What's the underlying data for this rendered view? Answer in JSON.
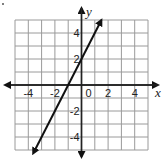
{
  "chart_data": {
    "type": "line",
    "title": "",
    "xlabel": "x",
    "ylabel": "y",
    "xlim": [
      -5,
      5
    ],
    "ylim": [
      -5,
      5
    ],
    "grid": true,
    "grid_step": 1,
    "x_tick_labels": [
      "-4",
      "-2",
      "0",
      "2",
      "4"
    ],
    "x_ticks": [
      -4,
      -2,
      0,
      2,
      4
    ],
    "y_tick_labels": [
      "4",
      "2",
      "-2",
      "-4"
    ],
    "y_ticks": [
      4,
      2,
      -2,
      -4
    ],
    "series": [
      {
        "name": "y = 2x + 2",
        "equation": "y = 2x + 2",
        "slope": 2,
        "intercept": 2,
        "x": [
          -3.5,
          -1,
          0,
          1.5
        ],
        "y": [
          -5,
          0,
          2,
          5
        ],
        "arrows_both_ends": true
      }
    ],
    "legend": null
  },
  "labels": {
    "x": "x",
    "y": "y",
    "origin": "0"
  },
  "colors": {
    "grid": "#9a9a9a",
    "axis": "#222222",
    "line": "#111111"
  }
}
